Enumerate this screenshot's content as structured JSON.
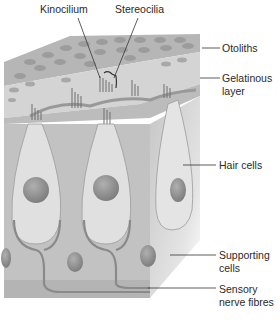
{
  "figure": {
    "labels": {
      "kinocilium": "Kinocilium",
      "stereocilia": "Stereocilia",
      "otoliths": "Otoliths",
      "gelatinous_line1": "Gelatinous",
      "gelatinous_line2": "layer",
      "hair_cells": "Hair cells",
      "supporting_line1": "Supporting",
      "supporting_line2": "cells",
      "sensory_line1": "Sensory",
      "sensory_line2": "nerve fibres"
    },
    "colors": {
      "background": "#ffffff",
      "otolith_layer": "#b8b8b8",
      "gelatinous_layer": "#d6d6d6",
      "tissue": "#c4c4c4",
      "hair_cell": "#e2e2e2",
      "nucleus": "#8e8e8e",
      "leader_line": "#333333",
      "text": "#2a2a2a"
    }
  }
}
